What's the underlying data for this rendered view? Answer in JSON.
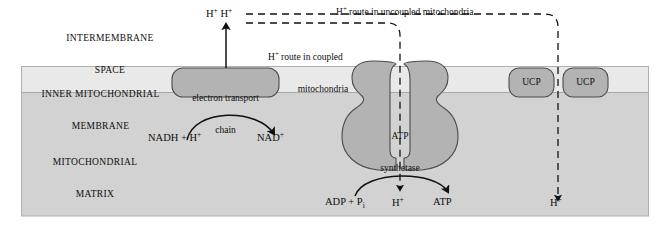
{
  "figure": {
    "background_color": "#ffffff",
    "outline_color": "#9a9a9a"
  },
  "colors": {
    "intermembrane_space": "#ffffff",
    "membrane_band": "#e9e9e9",
    "matrix": "#d2d2d2",
    "protein_fill": "#b3b3b3",
    "protein_stroke": "#4c4c4c",
    "line": "#111111",
    "text": "#0d0d0d"
  },
  "regions": [
    {
      "id": "intermembrane-space",
      "line1": "INTERMEMBRANE",
      "line2": "SPACE"
    },
    {
      "id": "inner-mitochondrial-membrane",
      "line1": "INNER MITOCHONDRIAL",
      "line2": "MEMBRANE"
    },
    {
      "id": "mitochondrial-matrix",
      "line1": "MITOCHONDRIAL",
      "line2": "MATRIX"
    }
  ],
  "proteins": {
    "electron_transport_chain": {
      "line1": "electron transport",
      "line2": "chain"
    },
    "atp_synthetase": {
      "line1": "ATP",
      "line2": "synthetase"
    },
    "ucp_left": "UCP",
    "ucp_right": "UCP"
  },
  "routes": {
    "uncoupled": {
      "text_before": "H",
      "superscript": "+",
      "text_after": " route in uncoupled mitochondria"
    },
    "coupled": {
      "text_before": "H",
      "superscript": "+",
      "text_after": " route in coupled",
      "line2": "mitochondria"
    }
  },
  "species": {
    "proton_pumped_pair": {
      "first": "H",
      "first_sup": "+",
      "second": "H",
      "second_sup": "+"
    },
    "nadh": {
      "text": "NADH + H",
      "sup": "+"
    },
    "nad_plus": {
      "text": "NAD",
      "sup": "+"
    },
    "adp_pi": {
      "text": "ADP + P",
      "sub": "i"
    },
    "proton_synthase": {
      "text": "H",
      "sup": "+"
    },
    "atp": {
      "text": "ATP"
    },
    "proton_ucp": {
      "text": "H",
      "sup": "+"
    }
  }
}
